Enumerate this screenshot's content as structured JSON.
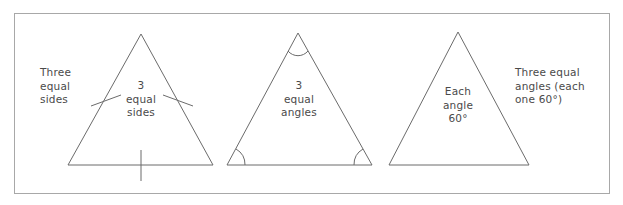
{
  "figure": {
    "background_color": "#ffffff",
    "frame_color": "#a8a8a8",
    "stroke_color": "#6b6b6b",
    "text_color": "#4a4a4a",
    "labels": {
      "left_outer": "Three\nequal\nsides",
      "triangle1_center": "3\nequal\nsides",
      "triangle2_center": "3\nequal\nangles",
      "triangle3_center": "Each\nangle\n60°",
      "right_outer": "Three equal\nangles (each\none 60°)"
    },
    "triangles": [
      {
        "name": "equilateral-triangle-sides",
        "apex": [
          141,
          34
        ],
        "bottom_left": [
          68,
          165
        ],
        "bottom_right": [
          213,
          165
        ],
        "marks": "tick-marks-on-each-side",
        "tick_count": 3
      },
      {
        "name": "equilateral-triangle-angles",
        "apex": [
          298,
          33
        ],
        "bottom_left": [
          227,
          165
        ],
        "bottom_right": [
          372,
          165
        ],
        "marks": "angle-arcs-at-each-vertex",
        "arc_count": 3
      },
      {
        "name": "equilateral-triangle-60-degrees",
        "apex": [
          458,
          32
        ],
        "bottom_left": [
          389,
          165
        ],
        "bottom_right": [
          529,
          165
        ],
        "marks": "none",
        "arc_count": 0
      }
    ]
  }
}
